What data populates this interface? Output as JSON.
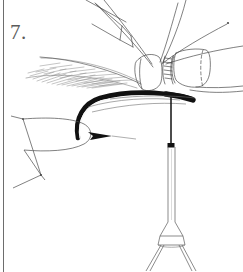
{
  "figure": {
    "label": "7.",
    "caption": "",
    "domain_kind": "line-drawing",
    "background_color": "#ffffff",
    "ink_color": "#1a1a1a",
    "light_ink_color": "#6d6d6d",
    "label_color": "#5b5b5b"
  },
  "border": {
    "side": "left",
    "color": "#6d6d6d",
    "width_px": 1
  },
  "parts": [
    {
      "id": "antenna-upper-left",
      "name": "upper-left antenna segment",
      "style": "thin outline"
    },
    {
      "id": "antenna-upper-right",
      "name": "upper-right antenna filament",
      "style": "thin line"
    },
    {
      "id": "eye-left",
      "name": "left compound eye",
      "style": "rounded quadrilateral"
    },
    {
      "id": "eye-right",
      "name": "right compound eye",
      "style": "cylinder with dashed end"
    },
    {
      "id": "palp-feathered",
      "name": "feathered maxillary palp",
      "style": "stippled wedge"
    },
    {
      "id": "proboscis",
      "name": "curved proboscis",
      "style": "thick black curve"
    },
    {
      "id": "labium-wedge",
      "name": "labium wedge",
      "style": "rounded teardrop"
    },
    {
      "id": "barb",
      "name": "barb tip",
      "style": "solid dark arrow"
    },
    {
      "id": "stylet",
      "name": "stylet shaft",
      "style": "thin vertical line"
    },
    {
      "id": "stylet-node",
      "name": "stylet node",
      "style": "dark band"
    },
    {
      "id": "stylet-tube",
      "name": "stylet tube",
      "style": "narrow parallel tube"
    },
    {
      "id": "foot-bell",
      "name": "terminal bell",
      "style": "trapezoid"
    },
    {
      "id": "foot-legs",
      "name": "splayed terminal legs",
      "style": "two diverging lines"
    }
  ]
}
